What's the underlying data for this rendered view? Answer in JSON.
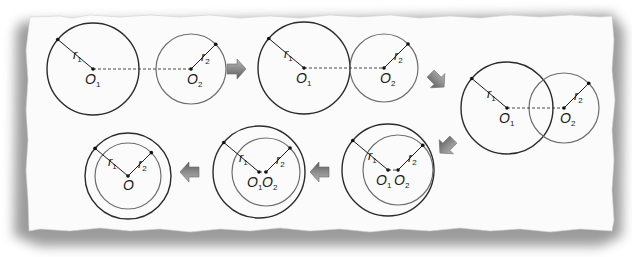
{
  "diagram": {
    "colors": {
      "paper": "#fbfbfb",
      "shadow": "#8a8a8a",
      "big_circle": "#2b2b2b",
      "small_circle": "#6e6e6e",
      "arrow": "#8c8c8c",
      "arrow_dark": "#5a5a5a"
    },
    "labels": {
      "r1": "r",
      "r1_sub": "1",
      "r2": "r",
      "r2_sub": "2",
      "O1": "O",
      "O1_sub": "1",
      "O2": "O",
      "O2_sub": "2",
      "O": "O"
    },
    "panels": [
      {
        "id": "separate",
        "name": "Circles apart (no intersection)",
        "big": {
          "cx": 93,
          "cy": 69,
          "r": 46
        },
        "small": {
          "cx": 191,
          "cy": 69,
          "r": 35
        },
        "center_line": true
      },
      {
        "id": "external-tangent",
        "name": "Externally tangent",
        "big": {
          "cx": 304,
          "cy": 68,
          "r": 46
        },
        "small": {
          "cx": 384,
          "cy": 68,
          "r": 34
        },
        "center_line": true
      },
      {
        "id": "intersecting",
        "name": "Intersecting",
        "big": {
          "cx": 507,
          "cy": 108,
          "r": 46
        },
        "small": {
          "cx": 564,
          "cy": 108,
          "r": 35
        },
        "center_line": true
      },
      {
        "id": "internal-tangent",
        "name": "Internally tangent",
        "big": {
          "cx": 388,
          "cy": 170,
          "r": 46
        },
        "small": {
          "cx": 398,
          "cy": 170,
          "r": 35
        },
        "center_line": true
      },
      {
        "id": "contained",
        "name": "One inside the other",
        "big": {
          "cx": 259,
          "cy": 172,
          "r": 46
        },
        "small": {
          "cx": 266,
          "cy": 172,
          "r": 34
        },
        "center_line": true
      },
      {
        "id": "concentric",
        "name": "Concentric",
        "big": {
          "cx": 128,
          "cy": 176,
          "r": 43
        },
        "small": {
          "cx": 128,
          "cy": 176,
          "r": 33
        },
        "center_line": false
      }
    ],
    "arrows": [
      {
        "direction": "right",
        "x": 236,
        "y": 69
      },
      {
        "direction": "down-right",
        "x": 437,
        "y": 80
      },
      {
        "direction": "down-left",
        "x": 447,
        "y": 146
      },
      {
        "direction": "left",
        "x": 320,
        "y": 172
      },
      {
        "direction": "left",
        "x": 190,
        "y": 172
      }
    ]
  }
}
